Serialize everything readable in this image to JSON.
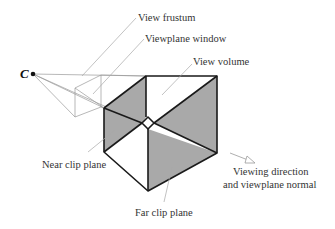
{
  "diagram": {
    "center_of_projection": {
      "label": "C"
    },
    "labels": {
      "view_frustum": "View frustum",
      "viewplane_window": "Viewplane window",
      "view_volume": "View volume",
      "near_clip_plane": "Near clip plane",
      "far_clip_plane": "Far clip plane",
      "viewing_direction_line1": "Viewing direction",
      "viewing_direction_line2": "and viewplane normal"
    },
    "colors": {
      "shade": "#a9a9a9",
      "edge": "#1a1a1a",
      "construction_line": "#9a9a9a",
      "text": "#333333"
    }
  }
}
